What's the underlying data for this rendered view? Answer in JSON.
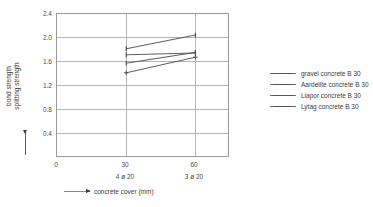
{
  "chart_data": {
    "type": "line",
    "title": "",
    "xlabel": "concrete cover (mm)",
    "ylabel_line1": "bond strength",
    "ylabel_line2": "splitting strength",
    "x": [
      30,
      60
    ],
    "xticks": [
      0,
      30,
      60
    ],
    "xtick_labels": [
      "0",
      "30",
      "60"
    ],
    "xsub_labels": [
      "",
      "4 ø 20",
      "3 ø 20"
    ],
    "xlim": [
      0,
      75
    ],
    "yticks": [
      0.4,
      0.8,
      1.2,
      1.6,
      2.0,
      2.4
    ],
    "ytick_labels": [
      "0.4",
      "0.8",
      "1.2",
      "1.6",
      "2.0",
      "2.4"
    ],
    "ylim": [
      0,
      2.4
    ],
    "grid": true,
    "legend_position": "right",
    "series": [
      {
        "name": "gravel concrete B 30",
        "values": [
          1.82,
          2.05
        ],
        "marker": "dash",
        "color": "#4a4a4a"
      },
      {
        "name": "Aardelite concrete B 30",
        "values": [
          1.72,
          1.75
        ],
        "marker": "dash",
        "color": "#4a4a4a"
      },
      {
        "name": "Liapor concrete B 30",
        "values": [
          1.58,
          1.76
        ],
        "marker": "dash",
        "color": "#4a4a4a"
      },
      {
        "name": "Lytag concrete B 30",
        "values": [
          1.42,
          1.68
        ],
        "marker": "plus",
        "color": "#4a4a4a"
      }
    ]
  },
  "legend": {
    "items": [
      {
        "label": "gravel concrete B 30",
        "marker": "dash"
      },
      {
        "label": "Aardelite concrete B 30",
        "marker": "dash"
      },
      {
        "label": "Liapor concrete B 30",
        "marker": "dash"
      },
      {
        "label": "Lytag concrete B 30",
        "marker": "plus"
      }
    ]
  },
  "axes": {
    "y_title_top": "bond strength",
    "y_title_bottom": "splitting strength",
    "x_title": "concrete cover (mm)"
  },
  "colors": {
    "line": "#4a4a4a",
    "grid": "#b4b4b4",
    "frame": "#9a9a9a",
    "text": "#3a3a3a",
    "background": "#ffffff"
  }
}
